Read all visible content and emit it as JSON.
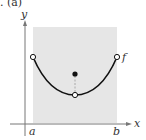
{
  "figure": {
    "part_label": ". (a)",
    "axis_labels": {
      "x": "x",
      "y": "y"
    },
    "interval_labels": {
      "left": "a",
      "right": "b"
    },
    "function_label": "f",
    "colors": {
      "shade": "#e6e6e6",
      "curve": "#111111",
      "axis": "#555555"
    },
    "points": {
      "left_endpoint": "open",
      "right_endpoint": "open",
      "minimum": "open",
      "filled_point_above_minimum": "closed"
    }
  }
}
